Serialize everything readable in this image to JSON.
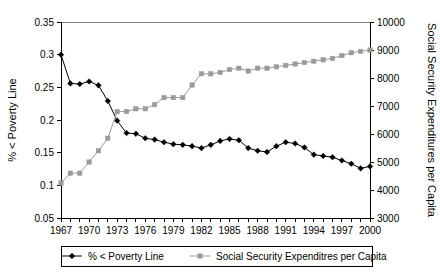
{
  "chart_data": {
    "type": "line",
    "title": "",
    "xlabel": "",
    "ylabel": "% < Poverty Line",
    "y2label": "Social Security Expenditures per Capita",
    "grid": false,
    "legend_position": "bottom",
    "x": [
      1967,
      1968,
      1969,
      1970,
      1971,
      1972,
      1973,
      1974,
      1975,
      1976,
      1977,
      1978,
      1979,
      1980,
      1981,
      1982,
      1983,
      1984,
      1985,
      1986,
      1987,
      1988,
      1989,
      1990,
      1991,
      1992,
      1993,
      1994,
      1995,
      1996,
      1997,
      1998,
      1999,
      2000
    ],
    "xlim": [
      1967,
      2000
    ],
    "xticks": [
      1967,
      1970,
      1973,
      1976,
      1979,
      1982,
      1985,
      1988,
      1991,
      1994,
      1997,
      2000
    ],
    "xticklabels": [
      "1967",
      "1970",
      "1973",
      "1976",
      "1979",
      "1982",
      "1985",
      "1988",
      "1991",
      "1994",
      "1997",
      "2000"
    ],
    "ylim": [
      0.05,
      0.35
    ],
    "yticks": [
      0.05,
      0.1,
      0.15,
      0.2,
      0.25,
      0.3,
      0.35
    ],
    "yticklabels": [
      "0.05",
      "0.1",
      "0.15",
      "0.2",
      "0.25",
      "0.3",
      "0.35"
    ],
    "y2lim": [
      3000,
      10000
    ],
    "y2ticks": [
      3000,
      4000,
      5000,
      6000,
      7000,
      8000,
      9000,
      10000
    ],
    "y2ticklabels": [
      "3000",
      "4000",
      "5000",
      "6000",
      "7000",
      "8000",
      "9000",
      "10000"
    ],
    "series": [
      {
        "name": "% < Poverty Line",
        "axis": "left",
        "color": "#000000",
        "marker": "diamond",
        "values": [
          0.3,
          0.256,
          0.255,
          0.259,
          0.253,
          0.229,
          0.199,
          0.18,
          0.179,
          0.172,
          0.17,
          0.166,
          0.163,
          0.162,
          0.16,
          0.157,
          0.162,
          0.168,
          0.171,
          0.169,
          0.157,
          0.153,
          0.151,
          0.16,
          0.166,
          0.164,
          0.158,
          0.147,
          0.145,
          0.143,
          0.138,
          0.133,
          0.126,
          0.129
        ]
      },
      {
        "name": "Social Security Expenditres per Capita",
        "axis": "right",
        "color": "#9a9a9a",
        "marker": "square",
        "values": [
          4250,
          4600,
          4600,
          5000,
          5400,
          5850,
          6800,
          6800,
          6900,
          6900,
          7050,
          7300,
          7300,
          7300,
          7750,
          8150,
          8150,
          8200,
          8300,
          8350,
          8250,
          8350,
          8350,
          8400,
          8450,
          8500,
          8550,
          8600,
          8650,
          8700,
          8800,
          8900,
          8950,
          9000
        ]
      }
    ],
    "legend": [
      {
        "label": "% < Poverty Line",
        "color": "#000000",
        "marker": "diamond"
      },
      {
        "label": "Social Security Expenditres per Capita",
        "color": "#9a9a9a",
        "marker": "square"
      }
    ]
  }
}
